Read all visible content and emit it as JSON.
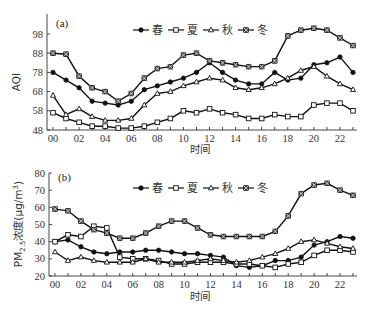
{
  "chart_data": [
    {
      "type": "line",
      "panel": "(a)",
      "title": "",
      "xlabel": "时间",
      "ylabel": "AQI",
      "ylim": [
        48,
        103
      ],
      "yticks": [
        48,
        58,
        68,
        78,
        88,
        98
      ],
      "xticks": [
        "00",
        "02",
        "04",
        "06",
        "08",
        "10",
        "12",
        "14",
        "16",
        "18",
        "20",
        "22"
      ],
      "x": [
        0,
        1,
        2,
        3,
        4,
        5,
        6,
        7,
        8,
        9,
        10,
        11,
        12,
        13,
        14,
        15,
        16,
        17,
        18,
        19,
        20,
        21,
        22,
        23
      ],
      "grid": false,
      "legend_position": "top-right",
      "series": [
        {
          "name": "春",
          "marker": "filled-circle",
          "values": [
            78,
            74,
            70,
            63,
            62,
            61,
            63,
            69,
            71,
            73,
            75,
            78,
            83,
            78,
            74,
            72,
            72,
            78,
            74,
            75,
            82,
            83,
            86,
            78
          ]
        },
        {
          "name": "夏",
          "marker": "open-square",
          "values": [
            57,
            54,
            52,
            50,
            50,
            49,
            49,
            50,
            52,
            54,
            58,
            57,
            59,
            57,
            56,
            54,
            54,
            56,
            55,
            55,
            61,
            62,
            62,
            58
          ]
        },
        {
          "name": "秋",
          "marker": "open-triangle",
          "values": [
            66,
            56,
            59,
            55,
            53,
            53,
            54,
            61,
            67,
            68,
            71,
            73,
            75,
            74,
            70,
            69,
            70,
            72,
            75,
            79,
            81,
            76,
            72,
            69
          ]
        },
        {
          "name": "冬",
          "marker": "x-square",
          "values": [
            88,
            87.5,
            76,
            70,
            68,
            63,
            67,
            75,
            80,
            81,
            87,
            88,
            84,
            83,
            82,
            81,
            81,
            84,
            97,
            100,
            101,
            100,
            96,
            92
          ]
        }
      ]
    },
    {
      "type": "line",
      "panel": "(b)",
      "title": "",
      "xlabel": "时间",
      "ylabel": "PM2.5浓度(μg/m³)",
      "ylim": [
        20,
        80
      ],
      "yticks": [
        20,
        30,
        40,
        50,
        60,
        70,
        80
      ],
      "xticks": [
        "00",
        "02",
        "04",
        "06",
        "08",
        "10",
        "12",
        "14",
        "16",
        "18",
        "20",
        "22"
      ],
      "x": [
        0,
        1,
        2,
        3,
        4,
        5,
        6,
        7,
        8,
        9,
        10,
        11,
        12,
        13,
        14,
        15,
        16,
        17,
        18,
        19,
        20,
        21,
        22,
        23
      ],
      "grid": false,
      "legend_position": "top-right",
      "series": [
        {
          "name": "春",
          "marker": "filled-circle",
          "values": [
            40,
            41,
            37,
            34,
            33,
            34,
            34,
            35,
            35,
            34,
            33,
            33,
            32,
            31,
            26,
            25,
            26,
            29,
            29,
            31,
            38,
            40,
            43,
            42
          ]
        },
        {
          "name": "夏",
          "marker": "open-square",
          "values": [
            40,
            44,
            43,
            49,
            48,
            31,
            30,
            30,
            29,
            27,
            27,
            28,
            28,
            28,
            27,
            27,
            26,
            25,
            27,
            28,
            32,
            35,
            35,
            34
          ]
        },
        {
          "name": "秋",
          "marker": "open-triangle",
          "values": [
            34,
            29,
            31,
            29,
            28,
            28,
            28,
            30,
            28,
            28,
            28,
            29,
            30,
            29,
            28,
            29,
            31,
            33,
            36,
            40,
            41,
            39,
            37,
            36
          ]
        },
        {
          "name": "冬",
          "marker": "x-square",
          "values": [
            59,
            58,
            52,
            47,
            45,
            42,
            42,
            45,
            49,
            52,
            52,
            48,
            44,
            43,
            43,
            43,
            43,
            46,
            55,
            68,
            73,
            74,
            70,
            67
          ]
        }
      ]
    }
  ],
  "labels": {
    "panel_a": "(a)",
    "panel_b": "(b)",
    "ylabel_a": "AQI",
    "ylabel_b_main": "PM",
    "ylabel_b_sub": "2.5",
    "ylabel_b_rest": "浓度(μg/m",
    "ylabel_b_sup": "3",
    "ylabel_b_close": ")",
    "xlabel_a": "时间",
    "xlabel_b": "时间"
  },
  "legend": [
    "春",
    "夏",
    "秋",
    "冬"
  ]
}
